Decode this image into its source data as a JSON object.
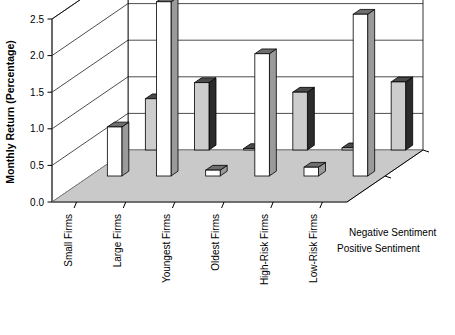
{
  "chart_data": {
    "type": "bar",
    "title": "",
    "xlabel": "",
    "ylabel": "Monthly Return (Percentage)",
    "ylim": [
      0.0,
      2.5
    ],
    "yticks": [
      "0.0",
      "0.5",
      "1.0",
      "1.5",
      "2.0",
      "2.5"
    ],
    "ytick_values": [
      0.0,
      0.5,
      1.0,
      1.5,
      2.0,
      2.5
    ],
    "grid": true,
    "projection": "3d",
    "legend_position": "right-bottom",
    "categories": [
      "Small Firms",
      "Large Firms",
      "Youngest Firms",
      "Oldest Firms",
      "High-Risk Firms",
      "Low-Risk Firms"
    ],
    "series": [
      {
        "name": "Positive Sentiment",
        "color": "#ffffff",
        "values": [
          0.67,
          2.38,
          0.08,
          1.67,
          0.12,
          2.21
        ]
      },
      {
        "name": "Negative Sentiment",
        "color": "#cdcdcd",
        "values": [
          0.7,
          0.92,
          0.02,
          0.79,
          0.03,
          0.93
        ]
      }
    ],
    "extra_series_note": "",
    "legend": [
      {
        "label": "Negative Sentiment"
      },
      {
        "label": "Positive Sentiment"
      }
    ]
  },
  "colors": {
    "bar_positive_front": "#ffffff",
    "bar_positive_side": "#9a9a9a",
    "bar_negative_front": "#cdcdcd",
    "bar_negative_side": "#2b2b2b",
    "floor": "#c9c9c9",
    "axis": "#000000"
  }
}
